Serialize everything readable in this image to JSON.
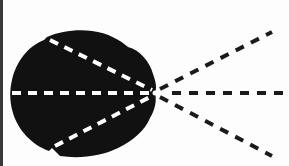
{
  "diagram": {
    "type": "ray-diagram",
    "colors": {
      "background": "#fdfdfd",
      "blob": "#111111",
      "inner_dashes": "#ffffff",
      "outer_dashes": "#1a1a1a",
      "left_border": "#3a3a3a"
    },
    "focal_point": {
      "x": 155,
      "y": 93
    },
    "rays": [
      {
        "name": "upper",
        "start": {
          "x": 48,
          "y": 38
        },
        "end": {
          "x": 272,
          "y": 32
        }
      },
      {
        "name": "middle",
        "start": {
          "x": 12,
          "y": 93
        },
        "end": {
          "x": 285,
          "y": 93
        }
      },
      {
        "name": "lower",
        "start": {
          "x": 52,
          "y": 148
        },
        "end": {
          "x": 272,
          "y": 156
        }
      }
    ]
  }
}
